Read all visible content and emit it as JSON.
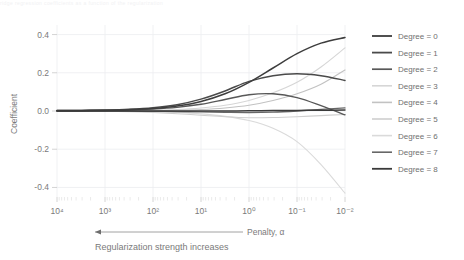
{
  "topstrip_text": "ridge regression coefficients as a function of the regularization",
  "chart_data": {
    "type": "line",
    "title": "",
    "xlabel": "Penalty, α",
    "xlabel_note": "Regularization strength increases",
    "ylabel": "Coefficient",
    "x_scale": "log",
    "x_reversed": true,
    "xlim": [
      10000,
      0.01
    ],
    "ylim": [
      -0.45,
      0.45
    ],
    "xticks": [
      "10⁴",
      "10³",
      "10²",
      "10¹",
      "10⁰",
      "10⁻¹",
      "10⁻²"
    ],
    "xtick_values": [
      10000,
      1000,
      100,
      10,
      1,
      0.1,
      0.01
    ],
    "yticks": [
      "0.4",
      "0.2",
      "0.0",
      "-0.2",
      "-0.4"
    ],
    "ytick_values": [
      0.4,
      0.2,
      0.0,
      -0.2,
      -0.4
    ],
    "grid": true,
    "legend_position": "right",
    "arrow_direction": "left",
    "x": [
      10000,
      3162,
      1000,
      316,
      100,
      31.6,
      10,
      3.16,
      1,
      0.316,
      0.1,
      0.0316,
      0.01
    ],
    "series": [
      {
        "name": "Degree = 0",
        "color": "#3d3d3d",
        "width": 1.5,
        "values": [
          0.002,
          0.003,
          0.004,
          0.007,
          0.013,
          0.026,
          0.05,
          0.09,
          0.15,
          0.225,
          0.3,
          0.355,
          0.385
        ]
      },
      {
        "name": "Degree = 1",
        "color": "#4a4a4a",
        "width": 1.5,
        "values": [
          0.002,
          0.003,
          0.005,
          0.009,
          0.017,
          0.033,
          0.062,
          0.105,
          0.155,
          0.185,
          0.195,
          0.185,
          0.16
        ]
      },
      {
        "name": "Degree = 2",
        "color": "#585858",
        "width": 1.4,
        "values": [
          0.001,
          0.002,
          0.003,
          0.005,
          0.01,
          0.019,
          0.035,
          0.06,
          0.085,
          0.09,
          0.07,
          0.028,
          -0.02
        ]
      },
      {
        "name": "Degree = 3",
        "color": "#d6d6d6",
        "width": 1.1,
        "values": [
          0.0,
          0.0,
          0.001,
          0.002,
          0.004,
          0.008,
          0.016,
          0.03,
          0.055,
          0.095,
          0.15,
          0.23,
          0.33
        ]
      },
      {
        "name": "Degree = 4",
        "color": "#c2c2c2",
        "width": 1.1,
        "values": [
          0.0,
          0.0,
          0.0,
          0.001,
          0.002,
          0.004,
          0.008,
          0.016,
          0.03,
          0.055,
          0.09,
          0.14,
          0.215
        ]
      },
      {
        "name": "Degree = 5",
        "color": "#cfcfcf",
        "width": 1.1,
        "values": [
          0.0,
          -0.001,
          -0.002,
          -0.004,
          -0.008,
          -0.014,
          -0.022,
          -0.03,
          -0.035,
          -0.034,
          -0.03,
          -0.024,
          -0.018
        ]
      },
      {
        "name": "Degree = 6",
        "color": "#dadada",
        "width": 1.1,
        "values": [
          0.0,
          0.0,
          -0.001,
          -0.002,
          -0.004,
          -0.008,
          -0.015,
          -0.028,
          -0.05,
          -0.09,
          -0.16,
          -0.28,
          -0.43
        ]
      },
      {
        "name": "Degree = 7",
        "color": "#676767",
        "width": 1.3,
        "values": [
          0.0,
          0.0,
          0.0,
          -0.001,
          -0.002,
          -0.003,
          -0.005,
          -0.007,
          -0.008,
          -0.006,
          0.0,
          0.008,
          0.016
        ]
      },
      {
        "name": "Degree = 8",
        "color": "#3a3a3a",
        "width": 1.5,
        "values": [
          0.0,
          0.0,
          0.0,
          0.0,
          0.0,
          0.0,
          0.0,
          0.0,
          0.001,
          0.002,
          0.003,
          0.004,
          0.005
        ]
      }
    ]
  }
}
